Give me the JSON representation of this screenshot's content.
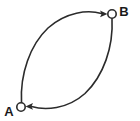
{
  "diagram": {
    "type": "directed-graph",
    "background_color": "#ffffff",
    "stroke_color": "#2b2b2b",
    "label_color": "#1a1a1a",
    "nodes": [
      {
        "id": "A",
        "label": "A",
        "shape": "circle",
        "filled": false,
        "cx": 21,
        "cy": 107,
        "r": 4.2,
        "label_x": 9,
        "label_y": 114
      },
      {
        "id": "B",
        "label": "B",
        "shape": "circle",
        "filled": false,
        "cx": 112,
        "cy": 14,
        "r": 4.2,
        "label_x": 120,
        "label_y": 14
      }
    ],
    "edges": [
      {
        "id": "edge-a-to-b",
        "from": "A",
        "to": "B",
        "style": "curved-arc",
        "direction": "A to B",
        "arrowhead": "at B, pointing right",
        "bulge": "left/upper"
      },
      {
        "id": "edge-b-to-a",
        "from": "B",
        "to": "A",
        "style": "curved-arc",
        "direction": "B to A",
        "arrowhead": "at A, pointing left",
        "bulge": "right/lower"
      }
    ]
  }
}
